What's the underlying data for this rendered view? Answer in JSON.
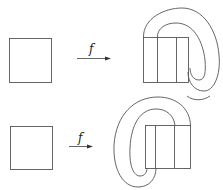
{
  "diagram": {
    "type": "horseshoe-map-illustration",
    "rows": [
      {
        "id": "top",
        "map_label": "f",
        "source": "square",
        "target": "horseshoe folded to the right, image overlaps square in vertical strips"
      },
      {
        "id": "bottom",
        "map_label": "f",
        "source": "square",
        "target": "horseshoe folded to the left, image overlaps square in vertical strips"
      }
    ],
    "colors": {
      "stroke": "#555555",
      "background": "#ffffff"
    }
  }
}
